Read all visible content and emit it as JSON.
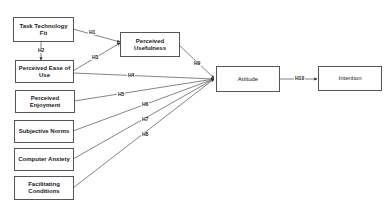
{
  "nodes": {
    "ttf": "Task Technology Fit",
    "peou": "Perceived Ease of Use",
    "pe": "Perceived  Enjoyment",
    "sn": "Subjective Norms",
    "ca": "Computer Anxiety",
    "fc": "Facilitating Conditions",
    "pu": "Perceived Usefulness",
    "att": "Attitude",
    "int": "Intention"
  },
  "hypotheses": {
    "h1": "H1",
    "h2": "H2",
    "h3": "H3",
    "h4": "H4",
    "h5": "H5",
    "h6": "H6",
    "h7": "H7",
    "h8": "H8",
    "h9": "H9",
    "h10": "H10"
  },
  "colors": {
    "line": "#555555",
    "box_border": "#555555",
    "background": "#ffffff"
  }
}
